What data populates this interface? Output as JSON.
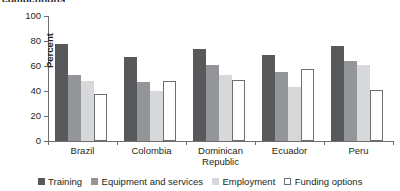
{
  "top_heading": "competitions",
  "chart_data": {
    "type": "bar",
    "title": "",
    "xlabel": "",
    "ylabel": "Percent",
    "ylim": [
      0,
      100
    ],
    "yticks": [
      0,
      20,
      40,
      60,
      80,
      100
    ],
    "ytick_labels": [
      "0",
      "20",
      "40",
      "60",
      "80",
      "100"
    ],
    "grid": false,
    "legend_position": "bottom",
    "categories": [
      "Brazil",
      "Colombia",
      "Dominican Republic",
      "Ecuador",
      "Peru"
    ],
    "series": [
      {
        "name": "Training",
        "color": "#58595b",
        "values": [
          78,
          67,
          74,
          69,
          76
        ]
      },
      {
        "name": "Equipment and services",
        "color": "#939598",
        "values": [
          53,
          47,
          61,
          55,
          64
        ]
      },
      {
        "name": "Employment",
        "color": "#d7d8da",
        "values": [
          48,
          40,
          53,
          43,
          61
        ]
      },
      {
        "name": "Funding options",
        "color": "#ffffff",
        "values": [
          38,
          48,
          49,
          58,
          41
        ]
      }
    ]
  },
  "axis": {
    "y_label": "Percent"
  },
  "legend": {
    "items": [
      {
        "label": "Training",
        "swatch": "s0"
      },
      {
        "label": "Equipment and services",
        "swatch": "s1"
      },
      {
        "label": "Employment",
        "swatch": "s2"
      },
      {
        "label": "Funding options",
        "swatch": "s3"
      }
    ]
  }
}
